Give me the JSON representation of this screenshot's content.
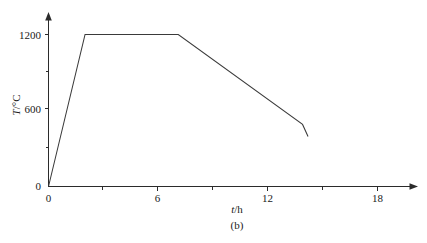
{
  "chart_data": {
    "type": "line",
    "title": "",
    "subtitle": "",
    "caption": "(b)",
    "xlabel": "t/h",
    "xlabel_italic_part": "t",
    "xlabel_rest": "/h",
    "ylabel": "T/°C",
    "ylabel_italic_part": "T",
    "ylabel_rest": "/°C",
    "xlim": [
      0,
      20
    ],
    "ylim": [
      0,
      1400
    ],
    "xticks": [
      0,
      6,
      12,
      18
    ],
    "xtick_labels": [
      "0",
      "6",
      "12",
      "18"
    ],
    "xminor_ticks": [
      3,
      9,
      15
    ],
    "yticks": [
      0,
      600,
      1200
    ],
    "ytick_labels": [
      "0",
      "600",
      "1200"
    ],
    "yminor_ticks": [
      300,
      900
    ],
    "grid": false,
    "legend": false,
    "legend_position": "none",
    "origin_label": "0",
    "axis_arrows": true,
    "series": [
      {
        "name": "heat treatment profile",
        "color": "#3a3a3a",
        "x": [
          0.0,
          2.0,
          7.1,
          13.9,
          14.2
        ],
        "y": [
          0,
          1200,
          1200,
          490,
          395
        ],
        "points": [
          {
            "t": 0.0,
            "T": 0,
            "note": "start"
          },
          {
            "t": 2.0,
            "T": 1200,
            "note": "end of heating ramp"
          },
          {
            "t": 7.1,
            "T": 1200,
            "note": "end of isothermal hold"
          },
          {
            "t": 13.9,
            "T": 490,
            "note": "end of slow cooling"
          },
          {
            "t": 14.2,
            "T": 395,
            "note": "end of fast cooling"
          }
        ]
      }
    ]
  },
  "labels": {
    "y_1200": "1200",
    "y_600": "600",
    "origin": "0",
    "x_0": "0",
    "x_6": "6",
    "x_12": "12",
    "x_18": "18"
  }
}
